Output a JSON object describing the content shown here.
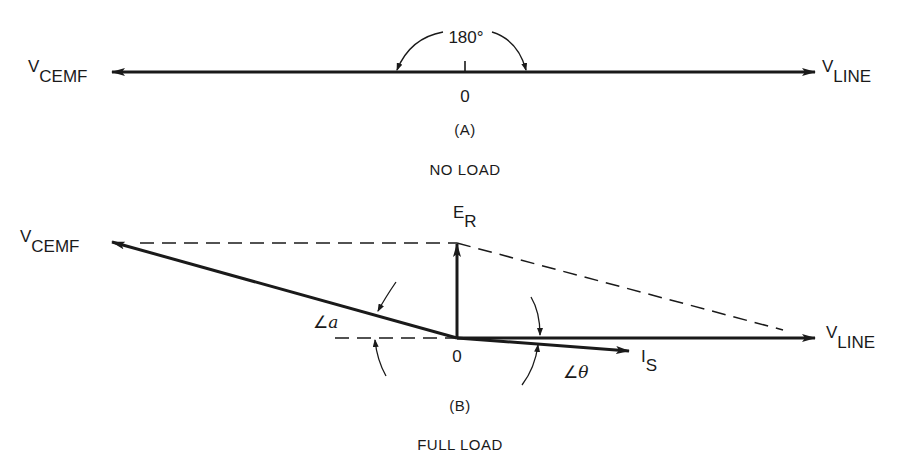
{
  "diagram_a": {
    "caption": "(A)",
    "condition": "NO LOAD",
    "origin_label": "0",
    "angle_label": "180°",
    "left_vector": {
      "main": "V",
      "sub": "CEMF"
    },
    "right_vector": {
      "main": "V",
      "sub": "LINE"
    }
  },
  "diagram_b": {
    "caption": "(B)",
    "condition": "FULL LOAD",
    "origin_label": "0",
    "left_vector": {
      "main": "V",
      "sub": "CEMF"
    },
    "right_vector": {
      "main": "V",
      "sub": "LINE"
    },
    "resultant_vector": {
      "main": "E",
      "sub": "R"
    },
    "current_vector": {
      "main": "I",
      "sub": "S"
    },
    "angle_alpha": {
      "symbol": "∠",
      "var": "a"
    },
    "angle_theta": {
      "symbol": "∠",
      "var": "θ"
    }
  },
  "colors": {
    "ink": "#1a1a1a",
    "background": "#ffffff"
  }
}
